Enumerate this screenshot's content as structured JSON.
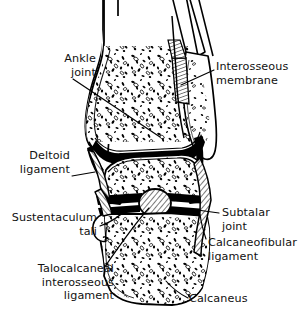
{
  "figure": {
    "background_color": "#ffffff",
    "ink_color": "#000000",
    "width": 307,
    "height": 318
  },
  "labels": {
    "ankle_joint": "Ankle\njoint",
    "interosseous_membrane": "Interosseous\nmembrane",
    "deltoid_ligament": "Deltoid\nligament",
    "sustentaculum_tali": "Sustentaculum\ntali",
    "talocalcaneal_interosseous_ligament": "Talocalcaneal\ninterosseous\nligament",
    "subtalar_joint": "Subtalar\njoint",
    "calcaneofibular_ligament": "Calcaneofibular\nligament",
    "calcaneus": "Calcaneus"
  },
  "structures": [
    {
      "name": "tibia",
      "description": "medial long bone shaft with distal expansion and medial malleolus"
    },
    {
      "name": "fibula",
      "description": "lateral long bone shaft ending in lateral malleolus"
    },
    {
      "name": "interosseous-membrane",
      "description": "hatched fibrous sheet between tibia and fibula"
    },
    {
      "name": "ankle-joint-space",
      "description": "black talocrural joint cavity"
    },
    {
      "name": "talus",
      "description": "central tarsal bone with trabecular stippling"
    },
    {
      "name": "subtalar-joint-space",
      "description": "black talocalcaneal joint cavity"
    },
    {
      "name": "talocalcaneal-interosseous-ligament",
      "description": "hatched oval ligament in sinus tarsi"
    },
    {
      "name": "calcaneus",
      "description": "inferior heel bone with trabecular stippling"
    },
    {
      "name": "deltoid-ligament",
      "description": "hatched medial collateral ligament"
    },
    {
      "name": "calcaneofibular-ligament",
      "description": "hatched lateral ligament band"
    },
    {
      "name": "sustentaculum-tali",
      "description": "medial shelf of calcaneus"
    }
  ]
}
